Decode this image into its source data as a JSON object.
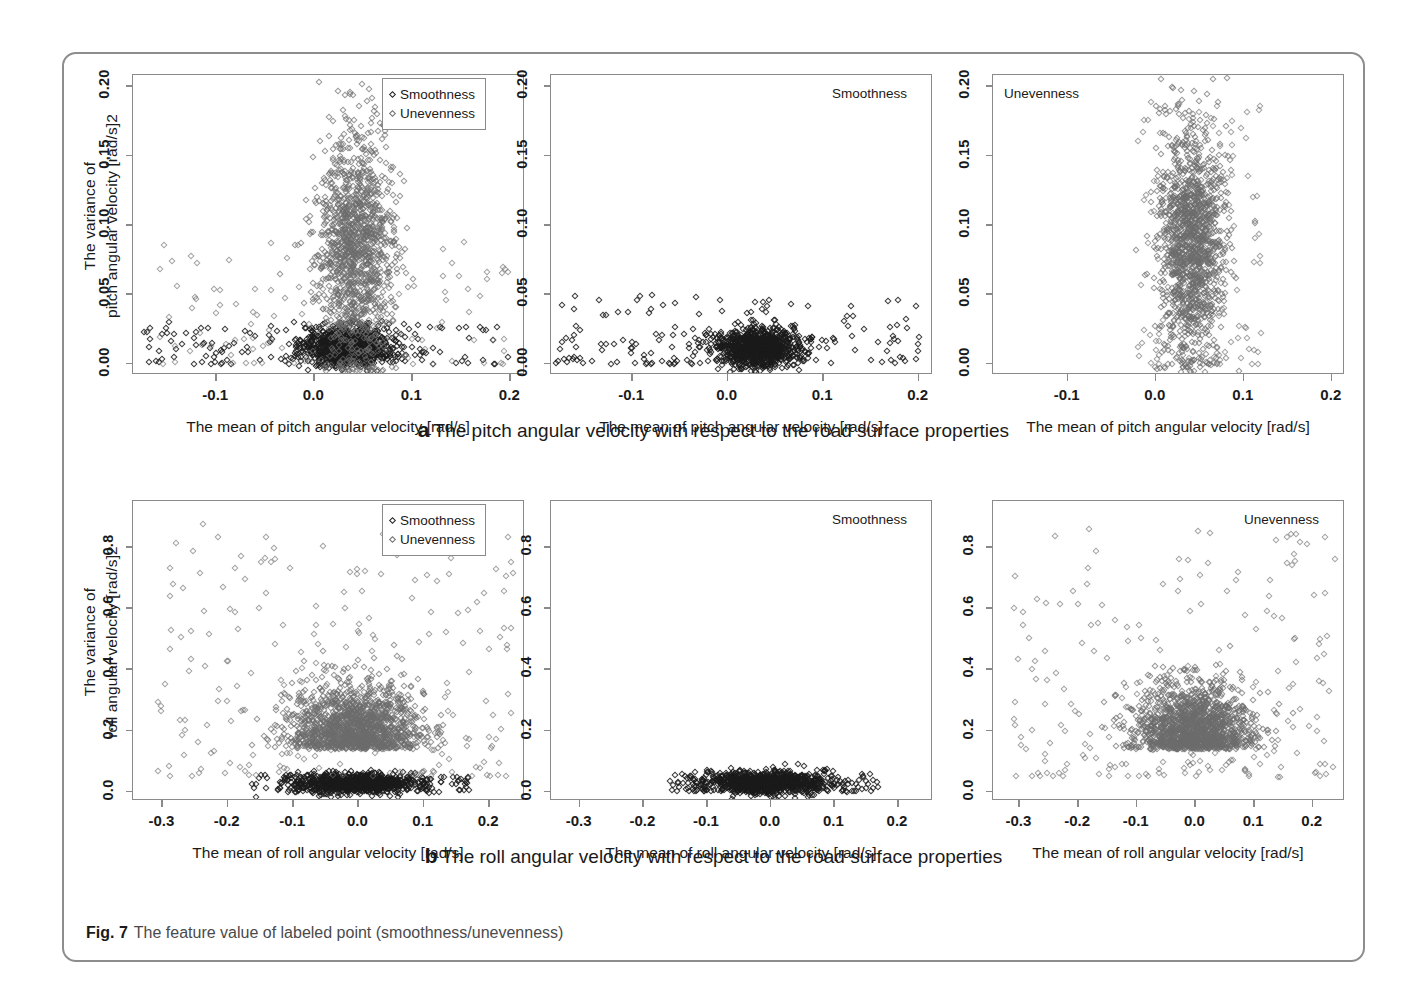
{
  "figure": {
    "caption_label": "Fig. 7",
    "caption_text": "The feature value of labeled point (smoothness/unevenness)",
    "subcaption_a_label": "a",
    "subcaption_a_text": "The pitch angular velocity with respect to the road surface properties",
    "subcaption_b_label": "b",
    "subcaption_b_text": "The roll angular velocity with respect to the road surface properties"
  },
  "legend": {
    "smoothness": "Smoothness",
    "unevenness": "Unevenness",
    "marker_smoothness_color": "#222222",
    "marker_unevenness_color": "#6e6e6e"
  },
  "chart_data": [
    {
      "type": "scatter",
      "id": "pitch-both",
      "title": "",
      "panel_label": "",
      "xlabel": "The mean of pitch angular velocity  [rad/s]",
      "ylabel_line1": "The variance of",
      "ylabel_line2": "pitch angular velocity  [rad/s]2",
      "xlim": [
        -0.185,
        0.215
      ],
      "ylim": [
        -0.008,
        0.208
      ],
      "xticks": [
        "-0.1",
        "0.0",
        "0.1",
        "0.2"
      ],
      "xtickvals": [
        -0.1,
        0.0,
        0.1,
        0.2
      ],
      "yticks": [
        "0.00",
        "0.05",
        "0.10",
        "0.15",
        "0.20"
      ],
      "ytickvals": [
        0.0,
        0.05,
        0.1,
        0.15,
        0.2
      ],
      "grid": false,
      "legend_position": "top-right",
      "series": [
        {
          "name": "Smoothness",
          "color": "#222222",
          "n_approx": 900,
          "cluster": {
            "cx": 0.032,
            "cy": 0.012,
            "sx": 0.022,
            "sy": 0.007
          },
          "tail": {
            "xrange": [
              -0.18,
              0.2
            ],
            "yrange": [
              0.0,
              0.03
            ],
            "n": 150
          }
        },
        {
          "name": "Unevenness",
          "color": "#6e6e6e",
          "n_approx": 1300,
          "cluster": {
            "cx": 0.042,
            "cy": 0.085,
            "sx": 0.02,
            "sy": 0.042
          },
          "tail": {
            "xrange": [
              -0.17,
              0.2
            ],
            "yrange": [
              0.0,
              0.09
            ],
            "n": 120
          }
        }
      ]
    },
    {
      "type": "scatter",
      "id": "pitch-smoothness",
      "panel_label": "Smoothness",
      "panel_label_position": "top-right",
      "xlabel": "The mean of pitch angular velocity  [rad/s]",
      "xlim": [
        -0.185,
        0.215
      ],
      "ylim": [
        -0.008,
        0.208
      ],
      "xticks": [
        "-0.1",
        "0.0",
        "0.1",
        "0.2"
      ],
      "xtickvals": [
        -0.1,
        0.0,
        0.1,
        0.2
      ],
      "yticks": [
        "0.00",
        "0.05",
        "0.10",
        "0.15",
        "0.20"
      ],
      "ytickvals": [
        0.0,
        0.05,
        0.1,
        0.15,
        0.2
      ],
      "grid": false,
      "series": [
        {
          "name": "Smoothness",
          "color": "#222222",
          "n_approx": 900,
          "cluster": {
            "cx": 0.032,
            "cy": 0.012,
            "sx": 0.022,
            "sy": 0.007
          },
          "tail": {
            "xrange": [
              -0.18,
              0.2
            ],
            "yrange": [
              0.0,
              0.05
            ],
            "n": 170
          }
        }
      ]
    },
    {
      "type": "scatter",
      "id": "pitch-unevenness",
      "panel_label": "Unevenness",
      "panel_label_position": "top-left",
      "xlabel": "The mean of pitch angular velocity  [rad/s]",
      "xlim": [
        -0.185,
        0.215
      ],
      "ylim": [
        -0.008,
        0.208
      ],
      "xticks": [
        "-0.1",
        "0.0",
        "0.1",
        "0.2"
      ],
      "xtickvals": [
        -0.1,
        0.0,
        0.1,
        0.2
      ],
      "yticks": [
        "0.00",
        "0.05",
        "0.10",
        "0.15",
        "0.20"
      ],
      "ytickvals": [
        0.0,
        0.05,
        0.1,
        0.15,
        0.2
      ],
      "grid": false,
      "series": [
        {
          "name": "Unevenness",
          "color": "#6e6e6e",
          "n_approx": 1400,
          "cluster": {
            "cx": 0.04,
            "cy": 0.088,
            "sx": 0.019,
            "sy": 0.042
          },
          "tail": {
            "xrange": [
              -0.02,
              0.12
            ],
            "yrange": [
              0.0,
              0.19
            ],
            "n": 140
          }
        }
      ]
    },
    {
      "type": "scatter",
      "id": "roll-both",
      "xlabel": "The mean of roll angular velocity  [rad/s]",
      "ylabel_line1": "The variance of",
      "ylabel_line2": "roll  angular velocity  [rad/s]2",
      "xlim": [
        -0.345,
        0.255
      ],
      "ylim": [
        -0.03,
        0.95
      ],
      "xticks": [
        "-0.3",
        "-0.2",
        "-0.1",
        "0.0",
        "0.1",
        "0.2"
      ],
      "xtickvals": [
        -0.3,
        -0.2,
        -0.1,
        0.0,
        0.1,
        0.2
      ],
      "yticks": [
        "0.0",
        "0.2",
        "0.4",
        "0.6",
        "0.8"
      ],
      "ytickvals": [
        0.0,
        0.2,
        0.4,
        0.6,
        0.8
      ],
      "grid": false,
      "legend_position": "top-right",
      "series": [
        {
          "name": "Smoothness",
          "color": "#222222",
          "n_approx": 800,
          "cluster": {
            "cx": -0.005,
            "cy": 0.028,
            "sx": 0.048,
            "sy": 0.016
          },
          "tail": {
            "xrange": [
              -0.16,
              0.17
            ],
            "yrange": [
              0.0,
              0.06
            ],
            "n": 120
          }
        },
        {
          "name": "Unevenness",
          "color": "#6e6e6e",
          "n_approx": 1500,
          "cluster": {
            "cx": -0.005,
            "cy": 0.2,
            "sx": 0.05,
            "sy": 0.085
          },
          "tail": {
            "xrange": [
              -0.31,
              0.24
            ],
            "yrange": [
              0.05,
              0.88
            ],
            "n": 230
          }
        }
      ]
    },
    {
      "type": "scatter",
      "id": "roll-smoothness",
      "panel_label": "Smoothness",
      "panel_label_position": "top-right",
      "xlabel": "The mean of roll angular velocity  [rad/s]",
      "xlim": [
        -0.345,
        0.255
      ],
      "ylim": [
        -0.03,
        0.95
      ],
      "xticks": [
        "-0.3",
        "-0.2",
        "-0.1",
        "0.0",
        "0.1",
        "0.2"
      ],
      "xtickvals": [
        -0.3,
        -0.2,
        -0.1,
        0.0,
        0.1,
        0.2
      ],
      "yticks": [
        "0.0",
        "0.2",
        "0.4",
        "0.6",
        "0.8"
      ],
      "ytickvals": [
        0.0,
        0.2,
        0.4,
        0.6,
        0.8
      ],
      "grid": false,
      "series": [
        {
          "name": "Smoothness",
          "color": "#222222",
          "n_approx": 900,
          "cluster": {
            "cx": -0.005,
            "cy": 0.03,
            "sx": 0.05,
            "sy": 0.018
          },
          "tail": {
            "xrange": [
              -0.16,
              0.17
            ],
            "yrange": [
              0.0,
              0.07
            ],
            "n": 130
          }
        }
      ]
    },
    {
      "type": "scatter",
      "id": "roll-unevenness",
      "panel_label": "Unevenness",
      "panel_label_position": "top-right",
      "xlabel": "The mean of roll angular velocity  [rad/s]",
      "xlim": [
        -0.345,
        0.255
      ],
      "ylim": [
        -0.03,
        0.95
      ],
      "xticks": [
        "-0.3",
        "-0.2",
        "-0.1",
        "0.0",
        "0.1",
        "0.2"
      ],
      "xtickvals": [
        -0.3,
        -0.2,
        -0.1,
        0.0,
        0.1,
        0.2
      ],
      "yticks": [
        "0.0",
        "0.2",
        "0.4",
        "0.6",
        "0.8"
      ],
      "ytickvals": [
        0.0,
        0.2,
        0.4,
        0.6,
        0.8
      ],
      "grid": false,
      "series": [
        {
          "name": "Unevenness",
          "color": "#6e6e6e",
          "n_approx": 1500,
          "cluster": {
            "cx": -0.005,
            "cy": 0.2,
            "sx": 0.05,
            "sy": 0.085
          },
          "tail": {
            "xrange": [
              -0.31,
              0.24
            ],
            "yrange": [
              0.05,
              0.88
            ],
            "n": 230
          }
        }
      ]
    }
  ]
}
